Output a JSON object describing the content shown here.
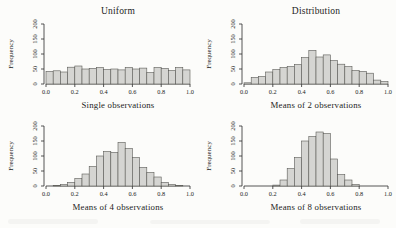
{
  "figure": {
    "background": "#fcfcfa",
    "bar_fill": "#d5d5d2",
    "bar_stroke": "#5a5a56",
    "axis_color": "#2b2b2b",
    "text_color": "#1c1c1c"
  },
  "chart_data": [
    {
      "type": "bar",
      "title": "Uniform",
      "xlabel": "Single observations",
      "ylabel": "Frequency",
      "bin_start": 0.0,
      "bin_width": 0.05,
      "values": [
        42,
        44,
        40,
        56,
        60,
        50,
        52,
        55,
        48,
        50,
        47,
        55,
        50,
        53,
        38,
        55,
        52,
        45,
        55,
        47
      ],
      "xlim": [
        0.0,
        1.0
      ],
      "ylim": [
        0,
        200
      ],
      "xticks": [
        "0.0",
        "0.2",
        "0.4",
        "0.6",
        "0.8",
        "1.0"
      ],
      "yticks": [
        0,
        50,
        100,
        150,
        200
      ],
      "grid": false,
      "legend": false
    },
    {
      "type": "bar",
      "title": "Distribution",
      "xlabel": "Means of 2 observations",
      "ylabel": "Frequency",
      "bin_start": 0.0,
      "bin_width": 0.05,
      "values": [
        4,
        22,
        25,
        40,
        48,
        55,
        58,
        65,
        88,
        112,
        90,
        97,
        78,
        66,
        58,
        45,
        42,
        36,
        13,
        8
      ],
      "xlim": [
        0.0,
        1.0
      ],
      "ylim": [
        0,
        200
      ],
      "xticks": [
        "0.0",
        "0.2",
        "0.4",
        "0.6",
        "0.8",
        "1.0"
      ],
      "yticks": [
        0,
        50,
        100,
        150,
        200
      ],
      "grid": false,
      "legend": false
    },
    {
      "type": "bar",
      "title": "",
      "xlabel": "Means of 4 observations",
      "ylabel": "Frequency",
      "bin_start": 0.0,
      "bin_width": 0.05,
      "values": [
        0,
        2,
        5,
        12,
        25,
        40,
        65,
        100,
        115,
        112,
        145,
        125,
        95,
        62,
        45,
        30,
        12,
        5,
        2,
        0
      ],
      "xlim": [
        0.0,
        1.0
      ],
      "ylim": [
        0,
        200
      ],
      "xticks": [
        "0.0",
        "0.2",
        "0.4",
        "0.6",
        "0.8",
        "1.0"
      ],
      "yticks": [
        0,
        50,
        100,
        150,
        200
      ],
      "grid": false,
      "legend": false
    },
    {
      "type": "bar",
      "title": "",
      "xlabel": "Means of 8 observations",
      "ylabel": "Frequency",
      "bin_start": 0.0,
      "bin_width": 0.05,
      "values": [
        0,
        0,
        0,
        0,
        3,
        20,
        58,
        95,
        150,
        165,
        180,
        175,
        90,
        38,
        20,
        5,
        0,
        0,
        0,
        0
      ],
      "xlim": [
        0.0,
        1.0
      ],
      "ylim": [
        0,
        200
      ],
      "xticks": [
        "0.0",
        "0.2",
        "0.4",
        "0.6",
        "0.8",
        "1.0"
      ],
      "yticks": [
        0,
        50,
        100,
        150,
        200
      ],
      "grid": false,
      "legend": false
    }
  ]
}
